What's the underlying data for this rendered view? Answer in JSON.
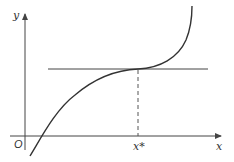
{
  "diagram": {
    "type": "function-graph",
    "labels": {
      "y_axis": "y",
      "x_axis": "x",
      "origin": "O",
      "critical_point": "x*"
    },
    "colors": {
      "axis": "#444444",
      "curve": "#333333",
      "tangent": "#444444",
      "dashed": "#555555",
      "text": "#333333"
    },
    "elements": [
      {
        "name": "x-axis",
        "kind": "arrow",
        "from": [
          10,
          136
        ],
        "to": [
          222,
          136
        ]
      },
      {
        "name": "y-axis",
        "kind": "arrow",
        "from": [
          25,
          150
        ],
        "to": [
          25,
          13
        ]
      },
      {
        "name": "horizontal-tangent",
        "kind": "line",
        "from": [
          48,
          69
        ],
        "to": [
          208,
          69
        ]
      },
      {
        "name": "dashed-drop-line",
        "kind": "dashed-line",
        "from": [
          138,
          69
        ],
        "to": [
          138,
          136
        ]
      },
      {
        "name": "curve",
        "kind": "path",
        "points": [
          [
            30,
            156
          ],
          [
            43,
            136
          ],
          [
            138,
            69
          ],
          [
            192,
            7
          ]
        ]
      }
    ]
  }
}
